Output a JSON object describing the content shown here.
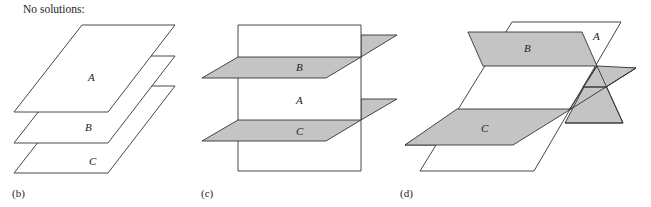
{
  "header": {
    "text": "No solutions:"
  },
  "colors": {
    "plane_white": "#ffffff",
    "plane_gray": "#c4c4c4",
    "stroke": "#333333"
  },
  "panels": [
    {
      "id": "b",
      "caption": "(b)",
      "caption_x": 12,
      "description": "Three parallel horizontal planes stacked",
      "planes": [
        {
          "label": "C",
          "fill": "white",
          "points": "82,86 175,86 108,173 14,173",
          "label_pos": [
            89,
            165
          ]
        },
        {
          "label": "B",
          "fill": "white",
          "points": "82,56 175,56 108,143 14,143",
          "label_pos": [
            85,
            131
          ]
        },
        {
          "label": "A",
          "fill": "white",
          "points": "82,25 175,25 108,112 14,112",
          "label_pos": [
            88,
            81
          ]
        }
      ],
      "lines": []
    },
    {
      "id": "c",
      "caption": "(c)",
      "caption_x": 201,
      "description": "Vertical plane A crossed by two parallel planes B and C",
      "planes": [
        {
          "label": "",
          "fill": "gray",
          "points": "361,35 397,35 361,57",
          "label_pos": null
        },
        {
          "label": "",
          "fill": "gray",
          "points": "361,99 397,99 361,120",
          "label_pos": null
        },
        {
          "label": "A",
          "fill": "white",
          "points": "238,25 361,25 361,171 238,171",
          "label_pos": [
            296,
            104
          ]
        },
        {
          "label": "B",
          "fill": "gray",
          "points": "238,57 361,57 326,78 202,78",
          "label_pos": [
            296,
            71
          ]
        },
        {
          "label": "C",
          "fill": "gray",
          "points": "238,120 361,120 326,141 202,141",
          "label_pos": [
            296,
            135
          ]
        }
      ],
      "lines": []
    },
    {
      "id": "d",
      "caption": "(d)",
      "caption_x": 400,
      "description": "Three planes intersecting pairwise in parallel lines",
      "planes": [
        {
          "label": "",
          "fill": "gray",
          "points": "528,68 636,68 571,109 513,145 405,145",
          "label_pos": null
        },
        {
          "label": "",
          "fill": "gray",
          "points": "597,66 623,123 565,123 584,87",
          "label_pos": null
        },
        {
          "label": "A",
          "fill": "white",
          "points": "512,22 621,22 534,171 420,171",
          "label_pos": [
            593,
            40
          ]
        },
        {
          "label": "B",
          "fill": "gray",
          "points": "468,32 582,32 597,66 483,66",
          "label_pos": [
            524,
            52
          ]
        },
        {
          "label": "",
          "fill": "gray",
          "points": "597,66 636,68 606,87 583,87",
          "label_pos": null
        },
        {
          "label": "C",
          "fill": "gray",
          "points": "457,109 571,109 513,145 405,145",
          "label_pos": [
            481,
            132
          ]
        }
      ],
      "lines": [
        "597,66 623,123",
        "584,87 606,87",
        "636,68 571,109",
        "597,66 569,110",
        "565,123 623,123"
      ]
    }
  ]
}
